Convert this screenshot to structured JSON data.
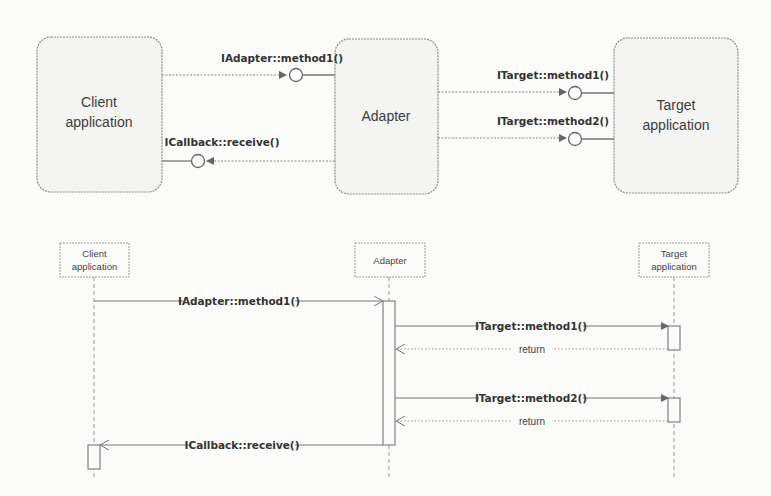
{
  "component_diagram": {
    "components": [
      {
        "id": "client",
        "label_lines": [
          "Client",
          "application"
        ]
      },
      {
        "id": "adapter",
        "label_lines": [
          "Adapter"
        ]
      },
      {
        "id": "target",
        "label_lines": [
          "Target",
          "application"
        ]
      }
    ],
    "interfaces": [
      {
        "label": "IAdapter::method1()",
        "from": "client",
        "to": "adapter"
      },
      {
        "label": "ICallback::receive()",
        "from": "adapter",
        "to": "client"
      },
      {
        "label": "ITarget::method1()",
        "from": "adapter",
        "to": "target"
      },
      {
        "label": "ITarget::method2()",
        "from": "adapter",
        "to": "target"
      }
    ]
  },
  "sequence_diagram": {
    "lifelines": [
      {
        "id": "client",
        "label_lines": [
          "Client",
          "application"
        ]
      },
      {
        "id": "adapter",
        "label_lines": [
          "Adapter"
        ]
      },
      {
        "id": "target",
        "label_lines": [
          "Target",
          "application"
        ]
      }
    ],
    "messages": [
      {
        "label": "IAdapter::method1()",
        "from": "client",
        "to": "adapter",
        "kind": "call"
      },
      {
        "label": "ITarget::method1()",
        "from": "adapter",
        "to": "target",
        "kind": "call"
      },
      {
        "label": "return",
        "from": "target",
        "to": "adapter",
        "kind": "return"
      },
      {
        "label": "ITarget::method2()",
        "from": "adapter",
        "to": "target",
        "kind": "call"
      },
      {
        "label": "return",
        "from": "target",
        "to": "adapter",
        "kind": "return"
      },
      {
        "label": "ICallback::receive()",
        "from": "adapter",
        "to": "client",
        "kind": "call"
      }
    ]
  },
  "colors": {
    "background": "#fbfbfa",
    "box_fill": "#f4f4f3",
    "stroke": "#7a7a7a",
    "text": "#3a3a3a"
  }
}
